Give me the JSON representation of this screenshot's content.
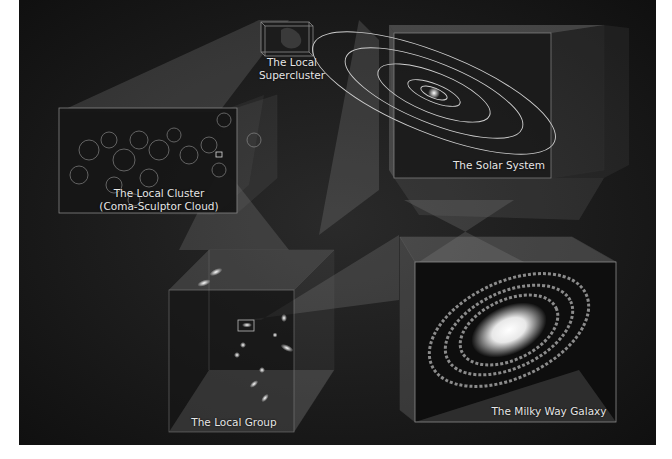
{
  "figure": {
    "colors": {
      "background": "#141414",
      "box_edge": "#8a8a8a",
      "beam": "#7a7a7a",
      "label": "#e6e6e6",
      "page": "#ffffff"
    },
    "panels": [
      {
        "id": "local-supercluster",
        "label_lines": [
          "The Local",
          "Supercluster"
        ]
      },
      {
        "id": "local-cluster",
        "label_lines": [
          "The Local Cluster",
          "(Coma-Sculptor Cloud)"
        ]
      },
      {
        "id": "solar-system",
        "label_lines": [
          "The Solar System"
        ]
      },
      {
        "id": "local-group",
        "label_lines": [
          "The Local Group"
        ]
      },
      {
        "id": "milky-way",
        "label_lines": [
          "The Milky Way Galaxy"
        ]
      }
    ]
  }
}
